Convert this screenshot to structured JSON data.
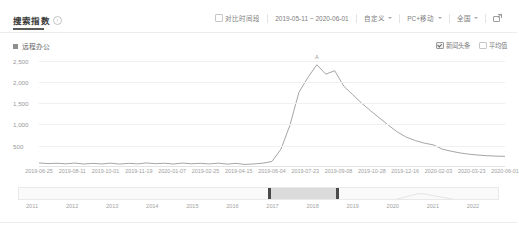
{
  "header": {
    "title": "搜索指数",
    "info_icon": "info-icon",
    "tooltip_glyph": "i"
  },
  "toolbar": {
    "compare_checkbox": {
      "label": "对比时间段",
      "checked": false
    },
    "date_range": "2019-05-11 ~ 2020-06-01",
    "custom": {
      "label": "自定义",
      "caret": "chevron-down-icon"
    },
    "device": {
      "label": "PC+移动",
      "caret": "chevron-down-icon"
    },
    "region": {
      "label": "全国",
      "caret": "chevron-down-icon"
    },
    "share_icon": "share-external-icon"
  },
  "legend": {
    "keyword": "远程办公",
    "keyword_color": "#8e8e8e",
    "options": [
      {
        "label": "新闻头条",
        "checked": true
      },
      {
        "label": "平均值",
        "checked": false
      }
    ]
  },
  "chart_data": {
    "type": "line",
    "title": "搜索指数",
    "xlabel": "",
    "ylabel": "",
    "series_name": "远程办公",
    "line_color": "#8e8e8e",
    "grid": true,
    "legend_position": "top-left",
    "ylim": [
      0,
      2700
    ],
    "yticks": [
      500,
      1000,
      1500,
      2000,
      2500
    ],
    "ytick_labels": [
      "500",
      "1,000",
      "1,500",
      "2,000",
      "2,500"
    ],
    "xlim": [
      "2019-05-11",
      "2020-06-01"
    ],
    "xtick_labels": [
      "2019-06-25",
      "2019-08-11",
      "2019-10-01",
      "2019-11-19",
      "2020-01-07",
      "2019-02-25",
      "2019-04-15",
      "2019-06-04",
      "2019-07-23",
      "2019-09-08",
      "2019-10-28",
      "2019-12-16",
      "2020-02-03",
      "2020-03-23",
      "2020-06-01"
    ],
    "annotations": [
      {
        "label": "A",
        "x": "2020-02-03",
        "y": 2400
      }
    ],
    "x": [
      "2019-05-11",
      "2019-05-21",
      "2019-05-31",
      "2019-06-10",
      "2019-06-20",
      "2019-06-30",
      "2019-07-10",
      "2019-07-20",
      "2019-07-30",
      "2019-08-09",
      "2019-08-19",
      "2019-08-29",
      "2019-09-08",
      "2019-09-18",
      "2019-09-28",
      "2019-10-08",
      "2019-10-18",
      "2019-10-28",
      "2019-11-07",
      "2019-11-17",
      "2019-11-27",
      "2019-12-07",
      "2019-12-17",
      "2019-12-27",
      "2020-01-06",
      "2020-01-16",
      "2020-01-21",
      "2020-01-24",
      "2020-01-27",
      "2020-01-30",
      "2020-02-01",
      "2020-02-03",
      "2020-02-05",
      "2020-02-07",
      "2020-02-09",
      "2020-02-11",
      "2020-02-14",
      "2020-02-17",
      "2020-02-20",
      "2020-02-24",
      "2020-02-28",
      "2020-03-04",
      "2020-03-09",
      "2020-03-14",
      "2020-03-20",
      "2020-03-28",
      "2020-04-05",
      "2020-04-15",
      "2020-04-25",
      "2020-05-05",
      "2020-05-15",
      "2020-05-25",
      "2020-06-01"
    ],
    "values": [
      95,
      80,
      88,
      75,
      92,
      70,
      85,
      72,
      90,
      68,
      86,
      74,
      95,
      78,
      88,
      70,
      92,
      76,
      86,
      72,
      90,
      68,
      84,
      60,
      72,
      90,
      130,
      420,
      980,
      1750,
      2100,
      2400,
      2180,
      2260,
      1900,
      1700,
      1500,
      1320,
      1150,
      980,
      820,
      700,
      620,
      560,
      520,
      420,
      370,
      330,
      300,
      280,
      265,
      255,
      250
    ]
  },
  "range_selector": {
    "selection_start_year": "2018.6",
    "selection_end_year": "2020.5",
    "years": [
      "2011",
      "2012",
      "2013",
      "2014",
      "2015",
      "2016",
      "2017",
      "2018",
      "2019",
      "2020",
      "2021",
      "2022"
    ]
  }
}
